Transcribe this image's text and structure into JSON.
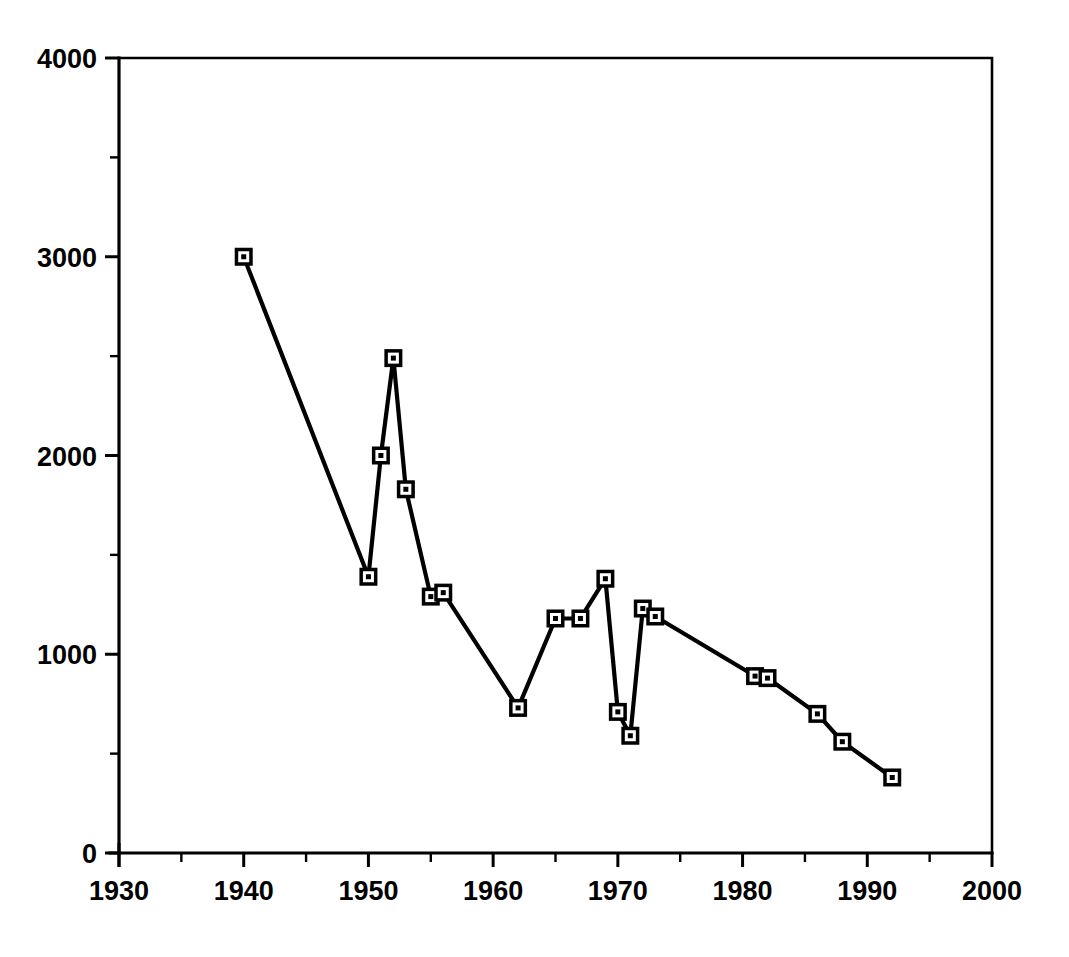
{
  "chart_data": {
    "type": "line",
    "title": "",
    "subtitle": "",
    "xlabel": "",
    "ylabel": "",
    "xlim": [
      1930,
      2000
    ],
    "ylim": [
      0,
      4000
    ],
    "grid": false,
    "legend": null,
    "legend_position": "none",
    "x_ticks": [
      1930,
      1940,
      1950,
      1960,
      1970,
      1980,
      1990,
      2000
    ],
    "x_tick_labels": [
      "1930",
      "1940",
      "1950",
      "1960",
      "1970",
      "1980",
      "1990",
      "2000"
    ],
    "x_minor_ticks": [
      1935,
      1945,
      1955,
      1965,
      1975,
      1985,
      1995
    ],
    "y_ticks": [
      0,
      1000,
      2000,
      3000,
      4000
    ],
    "y_tick_labels": [
      "0",
      "1000",
      "2000",
      "3000",
      "4000"
    ],
    "y_minor_ticks": [
      500,
      1500,
      2500,
      3500
    ],
    "marker": "square-with-center-dot",
    "line_color": "#000000",
    "marker_face_color": "#ffffff",
    "marker_edge_color": "#000000",
    "series": [
      {
        "name": "series-1",
        "x": [
          1940,
          1950,
          1951,
          1952,
          1953,
          1955,
          1956,
          1962,
          1965,
          1967,
          1969,
          1970,
          1971,
          1972,
          1973,
          1981,
          1982,
          1986,
          1988,
          1992
        ],
        "values": [
          3000,
          1390,
          2000,
          2490,
          1830,
          1290,
          1310,
          730,
          1180,
          1180,
          1380,
          710,
          590,
          1230,
          1190,
          890,
          880,
          700,
          560,
          380
        ]
      }
    ]
  },
  "figure": {
    "background_color": "#ffffff",
    "foreground_color": "#000000"
  }
}
